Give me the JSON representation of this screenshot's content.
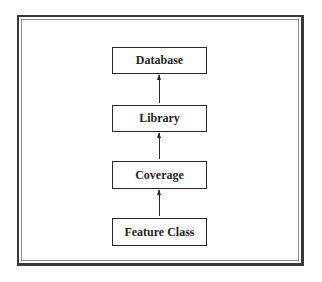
{
  "diagram": {
    "type": "hierarchy",
    "direction": "bottom-to-top",
    "nodes": [
      {
        "id": "database",
        "label": "Database"
      },
      {
        "id": "library",
        "label": "Library"
      },
      {
        "id": "coverage",
        "label": "Coverage"
      },
      {
        "id": "feature_class",
        "label": "Feature Class"
      }
    ],
    "edges": [
      {
        "from": "library",
        "to": "database"
      },
      {
        "from": "coverage",
        "to": "library"
      },
      {
        "from": "feature_class",
        "to": "coverage"
      }
    ]
  }
}
